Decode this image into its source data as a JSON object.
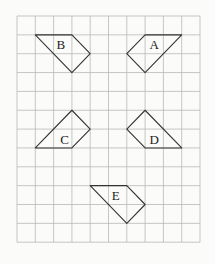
{
  "grid": {
    "columns": 10,
    "rows": 12,
    "origin_x": 17,
    "origin_y": 16,
    "cell_w": 18.3,
    "cell_h": 18.85,
    "line_color": "#b9b9b9"
  },
  "shapes": [
    {
      "label": "A",
      "points": [
        [
          7,
          1
        ],
        [
          9,
          1
        ],
        [
          7,
          3
        ],
        [
          6,
          2
        ]
      ],
      "label_pos": [
        7.5,
        1.5
      ]
    },
    {
      "label": "B",
      "points": [
        [
          1,
          1
        ],
        [
          3,
          1
        ],
        [
          4,
          2
        ],
        [
          3,
          3
        ]
      ],
      "label_pos": [
        2.4,
        1.5
      ]
    },
    {
      "label": "C",
      "points": [
        [
          1,
          7
        ],
        [
          3,
          7
        ],
        [
          4,
          6
        ],
        [
          3,
          5
        ]
      ],
      "label_pos": [
        2.6,
        6.5
      ]
    },
    {
      "label": "D",
      "points": [
        [
          7,
          5
        ],
        [
          6,
          6
        ],
        [
          7,
          7
        ],
        [
          9,
          7
        ]
      ],
      "label_pos": [
        7.5,
        6.5
      ]
    },
    {
      "label": "E",
      "points": [
        [
          4,
          9
        ],
        [
          6,
          9
        ],
        [
          7,
          10
        ],
        [
          6,
          11
        ]
      ],
      "label_pos": [
        5.4,
        9.5
      ]
    }
  ]
}
